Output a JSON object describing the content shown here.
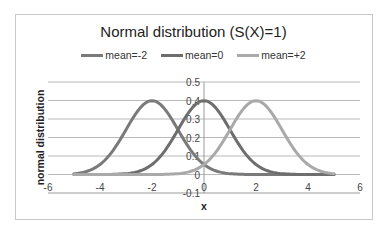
{
  "chart_data": {
    "type": "line",
    "title": "Normal distribution (S(X)=1)",
    "xlabel": "x",
    "ylabel": "normal distribution",
    "xlim": [
      -6,
      6
    ],
    "ylim": [
      -0.1,
      0.5
    ],
    "xticks": [
      -6,
      -4,
      -2,
      0,
      2,
      4,
      6
    ],
    "yticks": [
      -0.1,
      0,
      0.1,
      0.2,
      0.3,
      0.4,
      0.5
    ],
    "xtick_labels": [
      "-6",
      "-4",
      "-2",
      "0",
      "2",
      "4",
      "6"
    ],
    "ytick_labels": [
      "-0.1",
      "0",
      "0.1",
      "0.2",
      "0.3",
      "0.4",
      "0.5"
    ],
    "grid": "horizontal",
    "legend_position": "top",
    "sigma": 1,
    "x_range": [
      -5,
      5
    ],
    "series": [
      {
        "name": "mean=-2",
        "mean": -2,
        "color": "#7a7a7a"
      },
      {
        "name": "mean=0",
        "mean": 0,
        "color": "#6e6e6e"
      },
      {
        "name": "mean=+2",
        "mean": 2,
        "color": "#a9a9a9"
      }
    ]
  }
}
